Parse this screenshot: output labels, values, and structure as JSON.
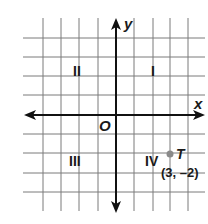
{
  "figure": {
    "type": "coordinate-plane",
    "axes": {
      "x_label": "x",
      "y_label": "y",
      "origin_label": "O"
    },
    "quadrants": [
      {
        "id": "I",
        "label": "I"
      },
      {
        "id": "II",
        "label": "II"
      },
      {
        "id": "III",
        "label": "III"
      },
      {
        "id": "IV",
        "label": "IV"
      }
    ],
    "point": {
      "name": "T",
      "coordinates": "(3, –2)",
      "x": 3,
      "y": -2,
      "color": "#8a8a8a"
    },
    "grid": {
      "x_range": [
        -5,
        4
      ],
      "y_range": [
        -4,
        4
      ],
      "line_color": "#7a7a7a",
      "axis_color": "#111111"
    }
  }
}
